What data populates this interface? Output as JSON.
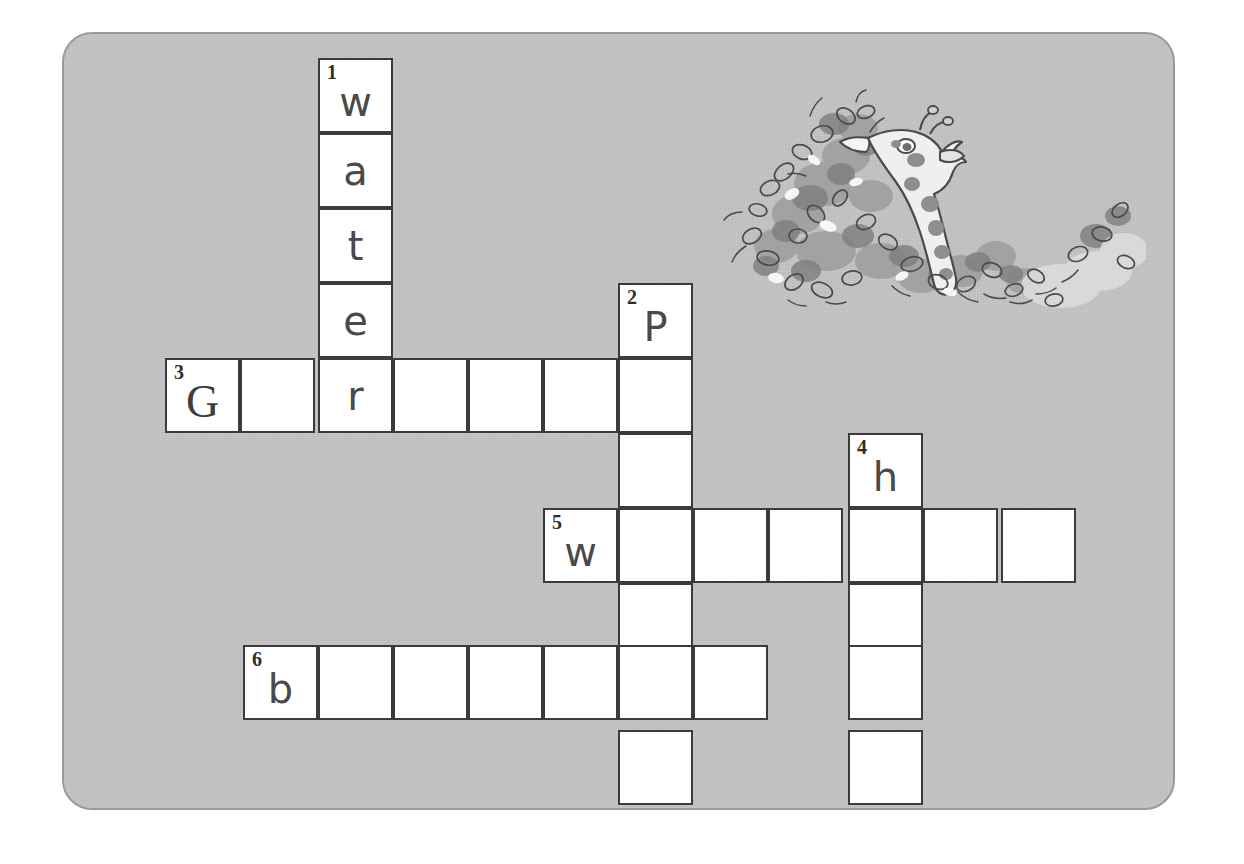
{
  "worksheet": {
    "type": "crossword-puzzle",
    "background_color": "#c3c3c3",
    "card_border_color": "#9a9a9a",
    "cell_fill_color": "#ffffff",
    "cell_border_color": "#3b3b3b",
    "cell_size_px": 75
  },
  "illustration": {
    "name": "giraffe-eating-foliage",
    "description": "Grayscale line-and-wash drawing of a giraffe with its long neck reaching into a leafy bush",
    "palette": {
      "ink": "#4a4a4a",
      "mid_gray": "#9b9b9b",
      "dark_gray": "#7d7d7d",
      "light_gray": "#d6d6d6",
      "highlight": "#f2f2f2"
    }
  },
  "entries": [
    {
      "number": "1",
      "direction": "down",
      "start_col": 2,
      "start_row": 0,
      "length": 5,
      "letters": [
        "w",
        "a",
        "t",
        "e",
        "r"
      ]
    },
    {
      "number": "2",
      "direction": "down",
      "start_col": 6,
      "start_row": 3,
      "length": 7,
      "letters": [
        "P",
        "",
        "",
        "",
        "",
        "",
        ""
      ]
    },
    {
      "number": "3",
      "direction": "across",
      "start_col": 0,
      "start_row": 4,
      "length": 7,
      "letters": [
        "G",
        "",
        "r",
        "",
        "",
        "",
        ""
      ]
    },
    {
      "number": "4",
      "direction": "down",
      "start_col": 9,
      "start_row": 5,
      "length": 5,
      "letters": [
        "h",
        "",
        "",
        "",
        ""
      ]
    },
    {
      "number": "5",
      "direction": "across",
      "start_col": 5,
      "start_row": 6,
      "length": 7,
      "letters": [
        "w",
        "",
        "",
        "",
        "",
        "",
        ""
      ]
    },
    {
      "number": "6",
      "direction": "across",
      "start_col": 1,
      "start_row": 8,
      "length": 7,
      "letters": [
        "b",
        "",
        "",
        "",
        "",
        "",
        ""
      ]
    }
  ],
  "cells": [
    {
      "id": "c-1-down-0",
      "x": 318,
      "y": 58,
      "number": "1",
      "letter": "w",
      "style": "sans-letter"
    },
    {
      "id": "c-1-down-1",
      "x": 318,
      "y": 133,
      "number": "",
      "letter": "a",
      "style": "sans-letter"
    },
    {
      "id": "c-1-down-2",
      "x": 318,
      "y": 208,
      "number": "",
      "letter": "t",
      "style": "sans-letter"
    },
    {
      "id": "c-1-down-3",
      "x": 318,
      "y": 283,
      "number": "",
      "letter": "e",
      "style": "sans-letter"
    },
    {
      "id": "c-2-down-0",
      "x": 618,
      "y": 283,
      "number": "2",
      "letter": "P",
      "style": "sans-letter"
    },
    {
      "id": "c-3-across-0",
      "x": 165,
      "y": 358,
      "number": "3",
      "letter": "G",
      "style": "serif-letter"
    },
    {
      "id": "c-3-across-1",
      "x": 240,
      "y": 358,
      "number": "",
      "letter": "",
      "style": "sans-letter"
    },
    {
      "id": "c-3-across-2",
      "x": 318,
      "y": 358,
      "number": "",
      "letter": "r",
      "style": "sans-letter"
    },
    {
      "id": "c-3-across-3",
      "x": 393,
      "y": 358,
      "number": "",
      "letter": "",
      "style": "sans-letter"
    },
    {
      "id": "c-3-across-4",
      "x": 468,
      "y": 358,
      "number": "",
      "letter": "",
      "style": "sans-letter"
    },
    {
      "id": "c-3-across-5",
      "x": 543,
      "y": 358,
      "number": "",
      "letter": "",
      "style": "sans-letter"
    },
    {
      "id": "c-3-across-6",
      "x": 618,
      "y": 358,
      "number": "",
      "letter": "",
      "style": "sans-letter"
    },
    {
      "id": "c-2-down-1",
      "x": 618,
      "y": 433,
      "number": "",
      "letter": "",
      "style": "sans-letter"
    },
    {
      "id": "c-4-down-0",
      "x": 848,
      "y": 433,
      "number": "4",
      "letter": "h",
      "style": "sans-letter"
    },
    {
      "id": "c-5-across-0",
      "x": 543,
      "y": 508,
      "number": "5",
      "letter": "w",
      "style": "sans-letter"
    },
    {
      "id": "c-5-across-1",
      "x": 618,
      "y": 508,
      "number": "",
      "letter": "",
      "style": "sans-letter"
    },
    {
      "id": "c-5-across-2",
      "x": 693,
      "y": 508,
      "number": "",
      "letter": "",
      "style": "sans-letter"
    },
    {
      "id": "c-5-across-3",
      "x": 768,
      "y": 508,
      "number": "",
      "letter": "",
      "style": "sans-letter"
    },
    {
      "id": "c-5-across-4",
      "x": 848,
      "y": 508,
      "number": "",
      "letter": "",
      "style": "sans-letter"
    },
    {
      "id": "c-5-across-5",
      "x": 923,
      "y": 508,
      "number": "",
      "letter": "",
      "style": "sans-letter"
    },
    {
      "id": "c-5-across-6",
      "x": 1001,
      "y": 508,
      "number": "",
      "letter": "",
      "style": "sans-letter"
    },
    {
      "id": "c-2-down-3",
      "x": 618,
      "y": 583,
      "number": "",
      "letter": "",
      "style": "sans-letter"
    },
    {
      "id": "c-4-down-2",
      "x": 848,
      "y": 583,
      "number": "",
      "letter": "",
      "style": "sans-letter"
    },
    {
      "id": "c-6-across-0",
      "x": 243,
      "y": 645,
      "number": "6",
      "letter": "b",
      "style": "sans-letter"
    },
    {
      "id": "c-6-across-1",
      "x": 318,
      "y": 645,
      "number": "",
      "letter": "",
      "style": "sans-letter"
    },
    {
      "id": "c-6-across-2",
      "x": 393,
      "y": 645,
      "number": "",
      "letter": "",
      "style": "sans-letter"
    },
    {
      "id": "c-6-across-3",
      "x": 468,
      "y": 645,
      "number": "",
      "letter": "",
      "style": "sans-letter"
    },
    {
      "id": "c-6-across-4",
      "x": 543,
      "y": 645,
      "number": "",
      "letter": "",
      "style": "sans-letter"
    },
    {
      "id": "c-6-across-5",
      "x": 618,
      "y": 645,
      "number": "",
      "letter": "",
      "style": "sans-letter"
    },
    {
      "id": "c-6-across-6",
      "x": 693,
      "y": 645,
      "number": "",
      "letter": "",
      "style": "sans-letter"
    },
    {
      "id": "c-4-down-3",
      "x": 848,
      "y": 645,
      "number": "",
      "letter": "",
      "style": "sans-letter"
    },
    {
      "id": "c-2-down-6",
      "x": 618,
      "y": 730,
      "number": "",
      "letter": "",
      "style": "sans-letter"
    },
    {
      "id": "c-4-down-4",
      "x": 848,
      "y": 730,
      "number": "",
      "letter": "",
      "style": "sans-letter"
    }
  ]
}
